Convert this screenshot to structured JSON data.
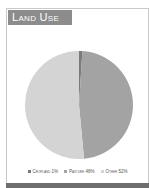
{
  "title": "Land Use",
  "chart_data": {
    "type": "pie",
    "title": "Land Use",
    "categories": [
      "Cropland",
      "Pasture",
      "Other"
    ],
    "values": [
      1,
      48,
      52
    ],
    "colors": [
      "#7a7a7a",
      "#a3a3a3",
      "#d4d4d4"
    ],
    "legend_position": "bottom"
  },
  "legend": [
    {
      "label": "Cropland 1%",
      "color": "#7a7a7a"
    },
    {
      "label": "Pasture 48%",
      "color": "#a3a3a3"
    },
    {
      "label": "Other 52%",
      "color": "#d4d4d4"
    }
  ]
}
